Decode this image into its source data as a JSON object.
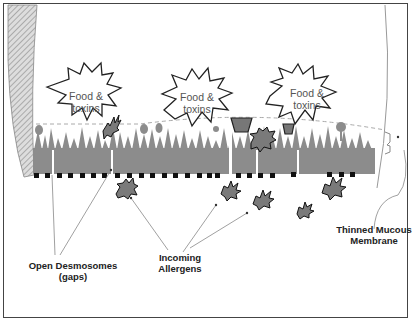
{
  "diagram": {
    "bursts": [
      {
        "line1": "Food &",
        "line2": "toxins"
      },
      {
        "line1": "Food &",
        "line2": "toxins"
      },
      {
        "line1": "Food &",
        "line2": "toxins"
      }
    ],
    "labels": {
      "desmosomes": "Open Desmosomes (gaps)",
      "allergens_line1": "Incoming",
      "allergens_line2": "Allergens",
      "mucous_line1": "Thinned Mucous",
      "mucous_line2": "Membrane"
    },
    "colors": {
      "cell": "#8c8c8c",
      "allergen": "#7a7a7a",
      "outline": "#222222",
      "border": "#444444"
    }
  }
}
